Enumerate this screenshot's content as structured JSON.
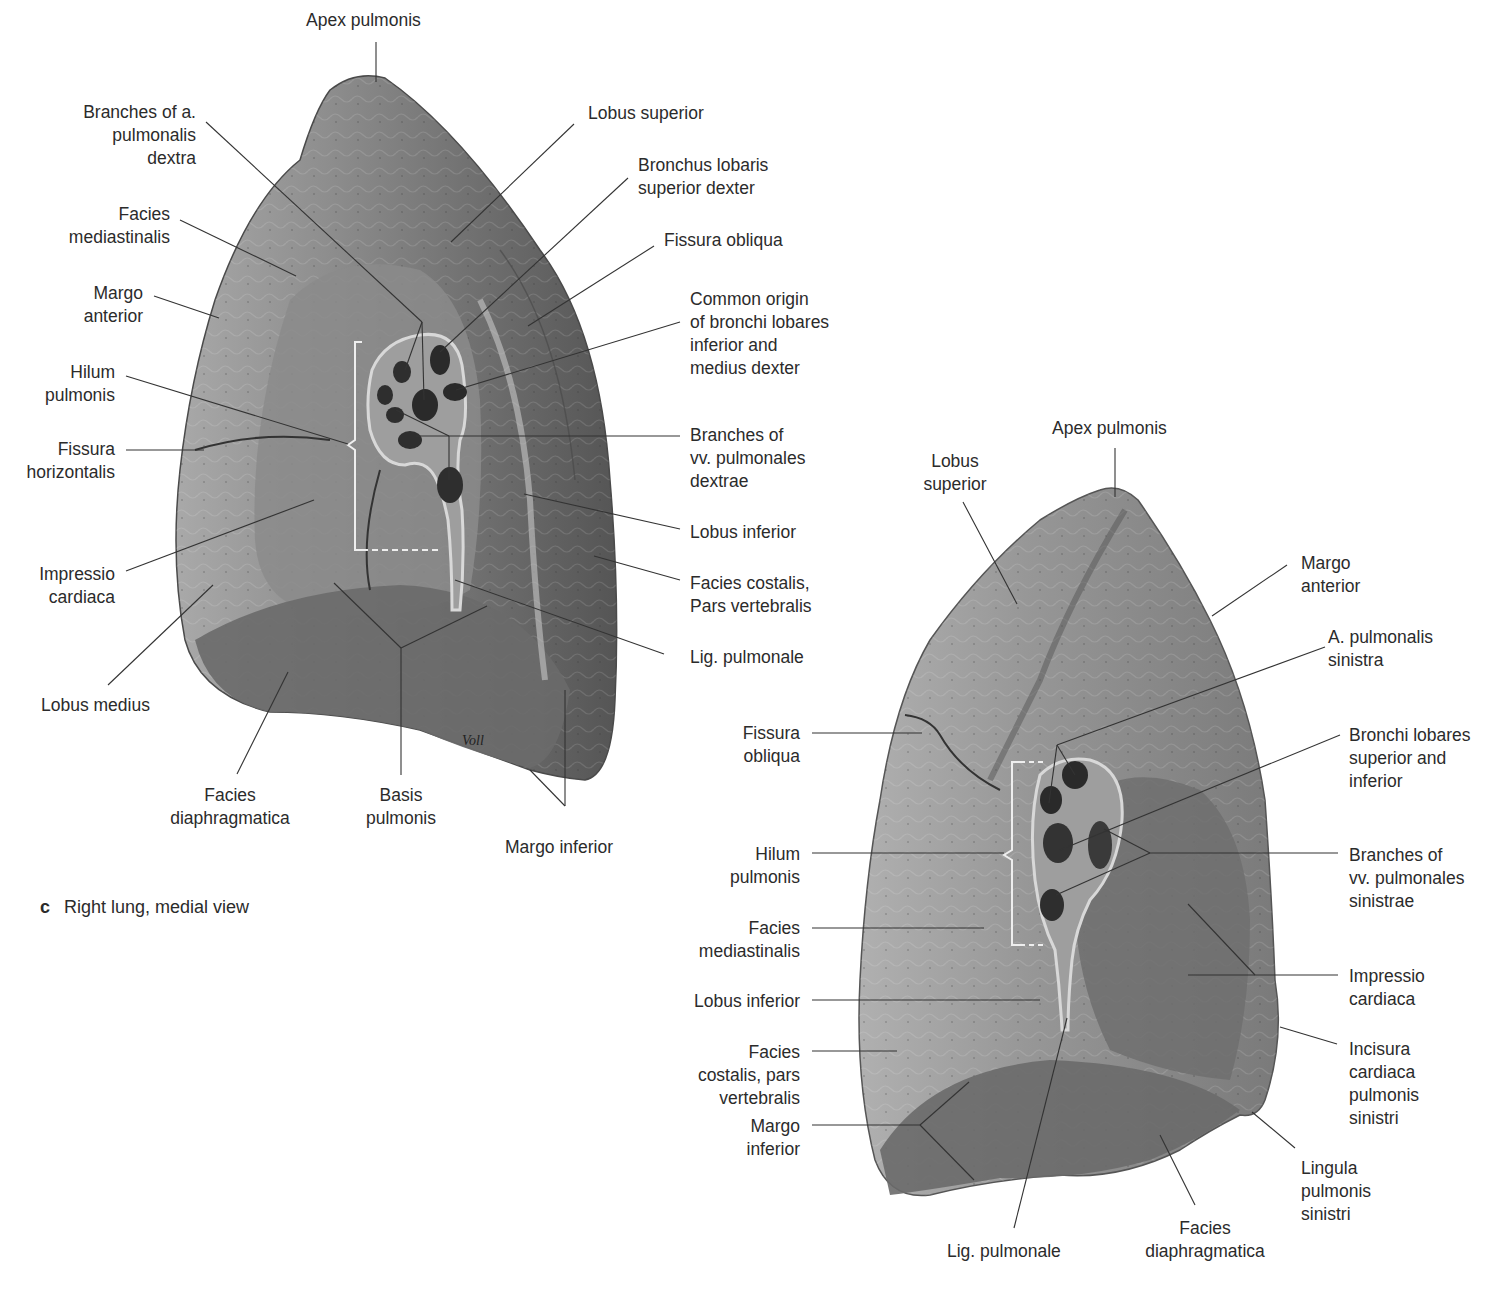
{
  "figure": {
    "caption_letter": "c",
    "caption_text": "Right lung, medial view"
  },
  "right_lung": {
    "labels": {
      "apex": [
        "Apex pulmonis"
      ],
      "branches_a_pulm": [
        "Branches of a.",
        "pulmonalis",
        "dextra"
      ],
      "facies_mediast": [
        "Facies",
        "mediastinalis"
      ],
      "margo_anterior": [
        "Margo",
        "anterior"
      ],
      "hilum": [
        "Hilum",
        "pulmonis"
      ],
      "fissura_horiz": [
        "Fissura",
        "horizontalis"
      ],
      "impressio": [
        "Impressio",
        "cardiaca"
      ],
      "lobus_medius": [
        "Lobus medius"
      ],
      "facies_diaph": [
        "Facies",
        "diaphragmatica"
      ],
      "basis": [
        "Basis",
        "pulmonis"
      ],
      "margo_inferior": [
        "Margo inferior"
      ],
      "lobus_superior": [
        "Lobus superior"
      ],
      "bronchus_sup": [
        "Bronchus lobaris",
        "superior dexter"
      ],
      "fissura_obliqua": [
        "Fissura obliqua"
      ],
      "common_origin": [
        "Common origin",
        "of bronchi lobares",
        "inferior and",
        "medius dexter"
      ],
      "branches_vv": [
        "Branches of",
        "vv. pulmonales",
        "dextrae"
      ],
      "lobus_inferior": [
        "Lobus inferior"
      ],
      "facies_costalis": [
        "Facies costalis,",
        "Pars vertebralis"
      ],
      "lig_pulm": [
        "Lig. pulmonale"
      ]
    }
  },
  "left_lung": {
    "labels": {
      "apex": [
        "Apex pulmonis"
      ],
      "lobus_superior": [
        "Lobus",
        "superior"
      ],
      "margo_anterior": [
        "Margo",
        "anterior"
      ],
      "a_pulm_sin": [
        "A. pulmonalis",
        "sinistra"
      ],
      "bronchi_lob": [
        "Bronchi lobares",
        "superior and",
        "inferior"
      ],
      "fissura_obliqua": [
        "Fissura",
        "obliqua"
      ],
      "hilum": [
        "Hilum",
        "pulmonis"
      ],
      "branches_vv": [
        "Branches of",
        "vv. pulmonales",
        "sinistrae"
      ],
      "facies_mediast": [
        "Facies",
        "mediastinalis"
      ],
      "impressio": [
        "Impressio",
        "cardiaca"
      ],
      "lobus_inferior": [
        "Lobus inferior"
      ],
      "incisura": [
        "Incisura",
        "cardiaca",
        "pulmonis",
        "sinistri"
      ],
      "facies_costalis": [
        "Facies",
        "costalis, pars",
        "vertebralis"
      ],
      "margo_inferior": [
        "Margo",
        "inferior"
      ],
      "lingula": [
        "Lingula",
        "pulmonis",
        "sinistri"
      ],
      "lig_pulm": [
        "Lig. pulmonale"
      ],
      "facies_diaph": [
        "Facies",
        "diaphragmatica"
      ]
    }
  },
  "signature": "Voll",
  "colors": {
    "lung_dark": "#5e5e5e",
    "lung_mid": "#8a8a8a",
    "lung_light": "#b4b4b4",
    "leader_line": "#333333",
    "text": "#2b2b2b"
  }
}
